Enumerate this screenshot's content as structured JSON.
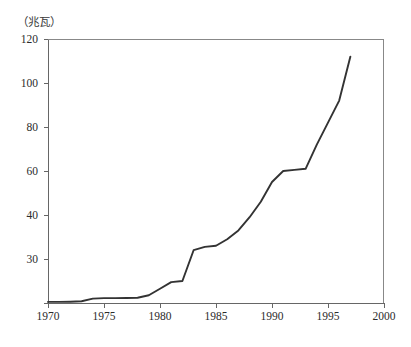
{
  "figure": {
    "unit_label": "（兆瓦）",
    "title_remnant": "",
    "background_color": "#ffffff",
    "line_color": "#333333",
    "axis_color": "#555555",
    "text_color": "#2b2b2b"
  },
  "chart_data": {
    "type": "line",
    "title": "",
    "subtitle": "",
    "xlabel": "",
    "ylabel": "（兆瓦）",
    "ylabel_note": "megawatts",
    "grid": false,
    "legend": null,
    "legend_position": "none",
    "xlim": [
      1970,
      2000
    ],
    "ylim": [
      0,
      120
    ],
    "xticks": [
      1970,
      1975,
      1980,
      1985,
      1990,
      1995,
      2000
    ],
    "xtick_labels": [
      "1970",
      "1975",
      "1980",
      "1985",
      "1990",
      "1995",
      "2000"
    ],
    "yticks": [
      0,
      20,
      40,
      60,
      80,
      100,
      120
    ],
    "ytick_labels": [
      "",
      "30",
      "40",
      "60",
      "80",
      "100",
      "120"
    ],
    "ytick_labels_note": "The tick at value 20 is printed as '30' in the source scan; the 0 tick is unlabeled.",
    "series": [
      {
        "name": "装机容量",
        "color": "#333333",
        "x": [
          1970,
          1971,
          1972,
          1973,
          1974,
          1975,
          1976,
          1977,
          1978,
          1979,
          1980,
          1981,
          1982,
          1983,
          1984,
          1985,
          1986,
          1987,
          1988,
          1989,
          1990,
          1991,
          1992,
          1993,
          1994,
          1995,
          1996,
          1997
        ],
        "values": [
          0.5,
          0.5,
          0.6,
          0.8,
          2.0,
          2.2,
          2.2,
          2.3,
          2.4,
          3.5,
          6.5,
          9.5,
          10.0,
          24.0,
          25.5,
          26.0,
          29.0,
          33.0,
          39.0,
          46.0,
          55.0,
          60.0,
          60.5,
          61.0,
          72.0,
          82.0,
          92.0,
          112.0
        ]
      }
    ]
  },
  "axes_geometry": {
    "plot_left_px": 48,
    "plot_right_px": 384,
    "plot_top_px": 39,
    "plot_bottom_px": 303
  }
}
